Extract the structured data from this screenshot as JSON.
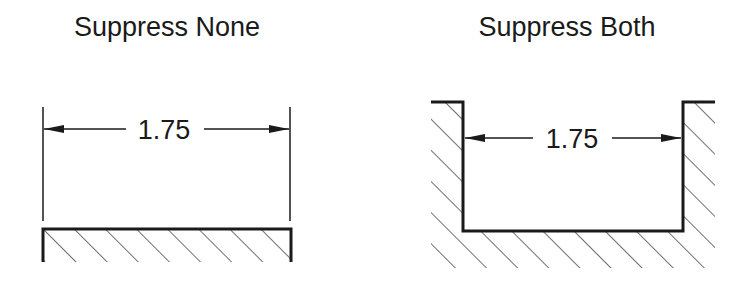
{
  "panels": [
    {
      "title": "Suppress None",
      "dimension_value": "1.75",
      "extension_lines": "shown",
      "part_shape": "flat hatched surface below dimension"
    },
    {
      "title": "Suppress Both",
      "dimension_value": "1.75",
      "extension_lines": "suppressed",
      "part_shape": "U-shaped hatched channel; dimension measured between inner walls"
    }
  ],
  "colors": {
    "line": "#1a1a1a",
    "hatch": "#333333",
    "background": "#ffffff"
  }
}
